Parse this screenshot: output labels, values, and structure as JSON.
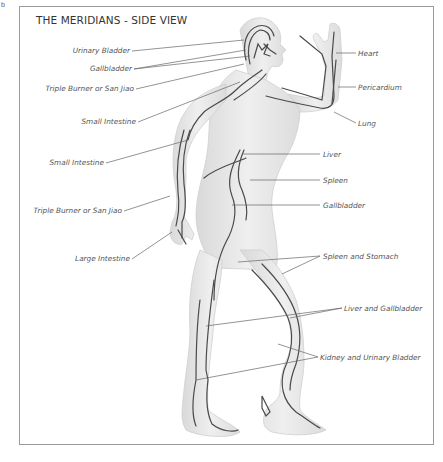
{
  "corner_mark": "b",
  "title": "THE MERIDIANS - SIDE VIEW",
  "colors": {
    "frame_border": "#9a9a9a",
    "body_fill": "#e9e9e9",
    "body_shade": "#d6d6d6",
    "meridian_line": "#4a4a4a",
    "leader_line": "#666666",
    "label_text": "#555555"
  },
  "labels_left": [
    {
      "id": "urinary-bladder",
      "text": "Urinary Bladder"
    },
    {
      "id": "gallbladder-head",
      "text": "Gallbladder"
    },
    {
      "id": "triple-burner-head",
      "text": "Triple Burner or San Jiao"
    },
    {
      "id": "small-intestine-shoulder",
      "text": "Small Intestine"
    },
    {
      "id": "small-intestine-arm",
      "text": "Small Intestine"
    },
    {
      "id": "triple-burner-arm",
      "text": "Triple Burner or San Jiao"
    },
    {
      "id": "large-intestine",
      "text": "Large Intestine"
    }
  ],
  "labels_right": [
    {
      "id": "heart",
      "text": "Heart"
    },
    {
      "id": "pericardium",
      "text": "Pericardium"
    },
    {
      "id": "lung",
      "text": "Lung"
    },
    {
      "id": "liver",
      "text": "Liver"
    },
    {
      "id": "spleen",
      "text": "Spleen"
    },
    {
      "id": "gallbladder-torso",
      "text": "Gallbladder"
    },
    {
      "id": "spleen-and-stomach",
      "text": "Spleen and Stomach"
    },
    {
      "id": "liver-and-gallbladder",
      "text": "Liver and Gallbladder"
    },
    {
      "id": "kidney-and-urinary-bladder",
      "text": "Kidney and Urinary Bladder"
    }
  ]
}
